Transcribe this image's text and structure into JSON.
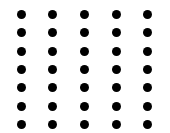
{
  "grid": {
    "columns": 5,
    "rows": 7,
    "dot_color": "#000000",
    "background": "#ffffff",
    "dot_diameter": 9,
    "col_centers": [
      21,
      52,
      84,
      116,
      147
    ],
    "row_centers": [
      14,
      32,
      51,
      69,
      87,
      106,
      124
    ]
  }
}
